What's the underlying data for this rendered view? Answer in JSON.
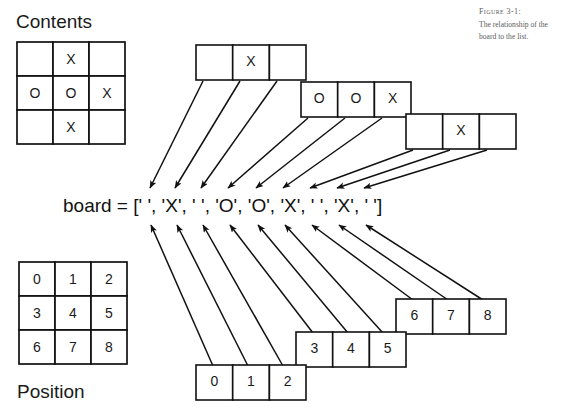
{
  "figure": {
    "caption_title": "Figure 3-1:",
    "caption_body": "The relationship of the board to the list."
  },
  "labels": {
    "contents": "Contents",
    "position": "Position"
  },
  "code": {
    "variable": "board",
    "equals": "=",
    "expression": "board = [' ', 'X', ' ', 'O', 'O', 'X', ' ', 'X', ' ']",
    "list_open": "[",
    "list_close": "]",
    "items": [
      "' '",
      "'X'",
      "' '",
      "'O'",
      "'O'",
      "'X'",
      "' '",
      "'X'",
      "' '"
    ]
  },
  "contents_grid": {
    "rows": [
      [
        "",
        "X",
        ""
      ],
      [
        "O",
        "O",
        "X"
      ],
      [
        "",
        "X",
        ""
      ]
    ]
  },
  "position_grid": {
    "rows": [
      [
        "0",
        "1",
        "2"
      ],
      [
        "3",
        "4",
        "5"
      ],
      [
        "6",
        "7",
        "8"
      ]
    ]
  },
  "contents_strips": [
    {
      "name": "contents-strip-row-0",
      "cells": [
        "",
        "X",
        ""
      ]
    },
    {
      "name": "contents-strip-row-1",
      "cells": [
        "O",
        "O",
        "X"
      ]
    },
    {
      "name": "contents-strip-row-2",
      "cells": [
        "",
        "X",
        ""
      ]
    }
  ],
  "position_strips": [
    {
      "name": "position-strip-row-2",
      "cells": [
        "6",
        "7",
        "8"
      ]
    },
    {
      "name": "position-strip-row-1",
      "cells": [
        "3",
        "4",
        "5"
      ]
    },
    {
      "name": "position-strip-row-0",
      "cells": [
        "0",
        "1",
        "2"
      ]
    }
  ],
  "colors": {
    "ink": "#111111",
    "paper": "#ffffff",
    "caption": "#5c5c60"
  }
}
